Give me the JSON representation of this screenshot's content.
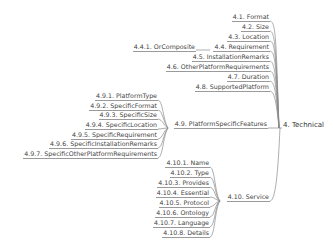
{
  "diagram": {
    "type": "mind-map",
    "root": {
      "label": "4. Technical"
    },
    "branches": [
      {
        "id": "4.1",
        "label": "4.1. Format"
      },
      {
        "id": "4.2",
        "label": "4.2. Size"
      },
      {
        "id": "4.3",
        "label": "4.3. Location"
      },
      {
        "id": "4.4",
        "label": "4.4. Requirement",
        "children": [
          {
            "id": "4.4.1",
            "label": "4.4.1. OrComposite"
          }
        ]
      },
      {
        "id": "4.5",
        "label": "4.5. InstallationRemarks"
      },
      {
        "id": "4.6",
        "label": "4.6. OtherPlatformRequirements"
      },
      {
        "id": "4.7",
        "label": "4.7. Duration"
      },
      {
        "id": "4.8",
        "label": "4.8. SupportedPlatform"
      },
      {
        "id": "4.9",
        "label": "4.9. PlatformSpecificFeatures",
        "children": [
          {
            "id": "4.9.1",
            "label": "4.9.1. PlatformType"
          },
          {
            "id": "4.9.2",
            "label": "4.9.2. SpecificFormat"
          },
          {
            "id": "4.9.3",
            "label": "4.9.3. SpecificSize"
          },
          {
            "id": "4.9.4",
            "label": "4.9.4. SpecificLocation"
          },
          {
            "id": "4.9.5",
            "label": "4.9.5. SpecificRequirement"
          },
          {
            "id": "4.9.6",
            "label": "4.9.6. SpecificInstallationRemarks"
          },
          {
            "id": "4.9.7",
            "label": "4.9.7. SpecificOtherPlatformRequirements"
          }
        ]
      },
      {
        "id": "4.10",
        "label": "4.10. Service",
        "children": [
          {
            "id": "4.10.1",
            "label": "4.10.1. Name"
          },
          {
            "id": "4.10.2",
            "label": "4.10.2. Type"
          },
          {
            "id": "4.10.3",
            "label": "4.10.3. Provides"
          },
          {
            "id": "4.10.4",
            "label": "4.10.4. Essential"
          },
          {
            "id": "4.10.5",
            "label": "4.10.5. Protocol"
          },
          {
            "id": "4.10.6",
            "label": "4.10.6. Ontology"
          },
          {
            "id": "4.10.7",
            "label": "4.10.7. Language"
          },
          {
            "id": "4.10.8",
            "label": "4.10.8. Details"
          }
        ]
      }
    ]
  },
  "colors": {
    "text": "#444444",
    "line": "#9a9a9a",
    "background": "#ffffff"
  }
}
